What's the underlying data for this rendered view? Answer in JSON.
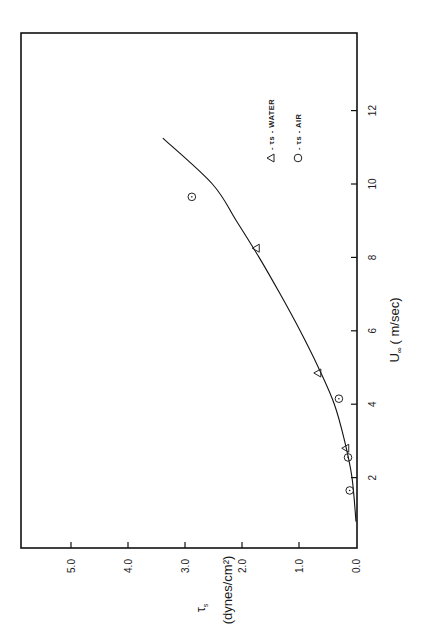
{
  "chart_data": {
    "type": "scatter",
    "orientation": "rotated-90-ccw",
    "title": "",
    "xlabel": "U∞ (m/sec)",
    "ylabel": "τs (dynes/cm²)",
    "xlim": [
      0,
      14
    ],
    "ylim": [
      0,
      5.8
    ],
    "x_ticks": [
      2,
      4,
      6,
      8,
      10,
      12
    ],
    "x_tick_labels": [
      "2",
      "4",
      "6",
      "8",
      "10",
      "12"
    ],
    "y_ticks": [
      0.0,
      1.0,
      2.0,
      3.0,
      4.0,
      5.0
    ],
    "y_tick_labels": [
      "0.0",
      "1.0",
      "2.0",
      "3.0",
      "4.0",
      "5.0"
    ],
    "grid": false,
    "legend_position": "upper-right (inside plot)",
    "series": [
      {
        "name": "τs - WATER",
        "marker": "triangle",
        "points": [
          {
            "x": 2.8,
            "y": 0.18
          },
          {
            "x": 4.85,
            "y": 0.67
          },
          {
            "x": 8.25,
            "y": 1.75
          }
        ]
      },
      {
        "name": "τs - AIR",
        "marker": "circle",
        "points": [
          {
            "x": 1.65,
            "y": 0.11
          },
          {
            "x": 2.55,
            "y": 0.14
          },
          {
            "x": 4.15,
            "y": 0.3
          },
          {
            "x": 9.65,
            "y": 2.88
          }
        ]
      },
      {
        "name": "fitted curve",
        "marker": "line",
        "points": [
          {
            "x": 0.8,
            "y": 0.0
          },
          {
            "x": 2.0,
            "y": 0.07
          },
          {
            "x": 3.0,
            "y": 0.2
          },
          {
            "x": 4.0,
            "y": 0.38
          },
          {
            "x": 5.0,
            "y": 0.66
          },
          {
            "x": 6.0,
            "y": 0.98
          },
          {
            "x": 7.0,
            "y": 1.33
          },
          {
            "x": 8.0,
            "y": 1.7
          },
          {
            "x": 9.0,
            "y": 2.1
          },
          {
            "x": 10.0,
            "y": 2.52
          },
          {
            "x": 11.25,
            "y": 3.39
          }
        ]
      }
    ]
  },
  "axes": {
    "x_title_main": "U",
    "x_title_sub": "∞",
    "x_title_unit": "( m/sec)",
    "y_title_symbol": "τ",
    "y_title_sub": "s",
    "y_title_unit": "(dynes/cm²)"
  },
  "legend": {
    "water_symbol": "Δ",
    "water_label": "- τs - WATER",
    "air_symbol": "○",
    "air_label": "- τs - AIR"
  }
}
